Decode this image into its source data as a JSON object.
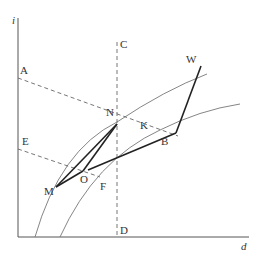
{
  "diagram": {
    "axes": {
      "y_label": "i",
      "x_label": "d"
    },
    "points": {
      "A": "A",
      "B": "B",
      "C": "C",
      "D": "D",
      "E": "E",
      "F": "F",
      "K": "K",
      "M": "M",
      "N": "N",
      "O": "O",
      "W": "W"
    },
    "colors": {
      "axis": "#555555",
      "curve": "#777777",
      "dashed": "#666666",
      "process": "#222222"
    }
  }
}
